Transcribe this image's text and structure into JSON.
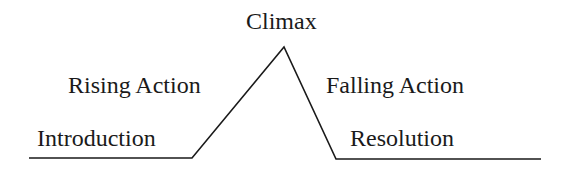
{
  "diagram": {
    "type": "plot-structure (Freytag's pyramid)",
    "line_color": "#1a1a1a",
    "labels": {
      "climax": "Climax",
      "rising_action": "Rising Action",
      "falling_action": "Falling Action",
      "introduction": "Introduction",
      "resolution": "Resolution"
    },
    "points": [
      {
        "name": "start",
        "x": 29,
        "y": 158
      },
      {
        "name": "intro-end",
        "x": 192,
        "y": 158
      },
      {
        "name": "peak",
        "x": 284,
        "y": 47
      },
      {
        "name": "fall-end",
        "x": 336,
        "y": 159
      },
      {
        "name": "end",
        "x": 541,
        "y": 159
      }
    ]
  }
}
